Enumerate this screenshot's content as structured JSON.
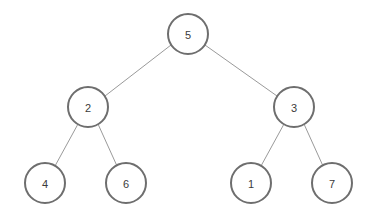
{
  "diagram": {
    "type": "binary-tree",
    "canvas": {
      "width": 373,
      "height": 220,
      "background": "#ffffff"
    },
    "style": {
      "node_fill": "#ffffff",
      "node_stroke": "#6e6e6e",
      "node_stroke_width": 2,
      "node_radius": 20,
      "label_color": "#3b3b3b",
      "edge_color": "#9a9a9a",
      "edge_width": 1
    },
    "nodes": [
      {
        "id": "n5",
        "label": "5",
        "cx": 188,
        "cy": 34,
        "r": 20,
        "level": 0,
        "role": "root"
      },
      {
        "id": "n2",
        "label": "2",
        "cx": 88,
        "cy": 107,
        "r": 20,
        "level": 1,
        "role": "left-child"
      },
      {
        "id": "n3",
        "label": "3",
        "cx": 294,
        "cy": 107,
        "r": 20,
        "level": 1,
        "role": "right-child"
      },
      {
        "id": "n4",
        "label": "4",
        "cx": 45,
        "cy": 183,
        "r": 20,
        "level": 2,
        "role": "leaf"
      },
      {
        "id": "n6",
        "label": "6",
        "cx": 126,
        "cy": 183,
        "r": 20,
        "level": 2,
        "role": "leaf"
      },
      {
        "id": "n1",
        "label": "1",
        "cx": 251,
        "cy": 183,
        "r": 20,
        "level": 2,
        "role": "leaf"
      },
      {
        "id": "n7",
        "label": "7",
        "cx": 332,
        "cy": 183,
        "r": 20,
        "level": 2,
        "role": "leaf"
      }
    ],
    "edges": [
      {
        "id": "e-5-2",
        "from": "n5",
        "to": "n2",
        "x1": 171,
        "y1": 45,
        "x2": 105,
        "y2": 96
      },
      {
        "id": "e-5-3",
        "from": "n5",
        "to": "n3",
        "x1": 205,
        "y1": 45,
        "x2": 277,
        "y2": 96
      },
      {
        "id": "e-2-4",
        "from": "n2",
        "to": "n4",
        "x1": 78,
        "y1": 124,
        "x2": 55,
        "y2": 166
      },
      {
        "id": "e-2-6",
        "from": "n2",
        "to": "n6",
        "x1": 98,
        "y1": 124,
        "x2": 117,
        "y2": 166
      },
      {
        "id": "e-3-1",
        "from": "n3",
        "to": "n1",
        "x1": 284,
        "y1": 124,
        "x2": 261,
        "y2": 166
      },
      {
        "id": "e-3-7",
        "from": "n3",
        "to": "n7",
        "x1": 304,
        "y1": 124,
        "x2": 323,
        "y2": 166
      }
    ]
  }
}
